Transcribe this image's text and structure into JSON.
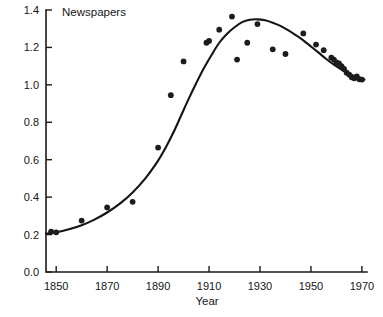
{
  "chart_data": {
    "type": "scatter",
    "title": "Newspapers",
    "xlabel": "Year",
    "ylabel": "",
    "xlim": [
      1846,
      1972
    ],
    "ylim": [
      0.0,
      1.4
    ],
    "grid": false,
    "legend": null,
    "xticks": [
      1850,
      1870,
      1890,
      1910,
      1930,
      1950,
      1970
    ],
    "xtick_labels": [
      "1850",
      "1870",
      "1890",
      "1910",
      "1930",
      "1950",
      "1970"
    ],
    "yticks": [
      0.0,
      0.2,
      0.4,
      0.6,
      0.8,
      1.0,
      1.2,
      1.4
    ],
    "ytick_labels": [
      "0.0",
      "0.2",
      "0.4",
      "0.6",
      "0.8",
      "1.0",
      "1.2",
      "1.4"
    ],
    "series": [
      {
        "name": "observed",
        "type": "scatter",
        "marker": "filled-circle",
        "color": "#1c1c1c",
        "points": [
          [
            1848,
            0.215
          ],
          [
            1850,
            0.212
          ],
          [
            1860,
            0.275
          ],
          [
            1870,
            0.345
          ],
          [
            1880,
            0.375
          ],
          [
            1890,
            0.665
          ],
          [
            1895,
            0.945
          ],
          [
            1900,
            1.125
          ],
          [
            1909,
            1.225
          ],
          [
            1910,
            1.235
          ],
          [
            1914,
            1.295
          ],
          [
            1919,
            1.365
          ],
          [
            1921,
            1.135
          ],
          [
            1925,
            1.225
          ],
          [
            1929,
            1.325
          ],
          [
            1935,
            1.19
          ],
          [
            1940,
            1.165
          ],
          [
            1947,
            1.275
          ],
          [
            1952,
            1.215
          ],
          [
            1955,
            1.185
          ],
          [
            1958,
            1.145
          ],
          [
            1959,
            1.135
          ],
          [
            1960,
            1.12
          ],
          [
            1961,
            1.115
          ],
          [
            1962,
            1.1
          ],
          [
            1963,
            1.085
          ],
          [
            1964,
            1.065
          ],
          [
            1965,
            1.055
          ],
          [
            1966,
            1.04
          ],
          [
            1967,
            1.035
          ],
          [
            1968,
            1.045
          ],
          [
            1969,
            1.03
          ],
          [
            1970,
            1.028
          ]
        ]
      },
      {
        "name": "fitted-curve",
        "type": "line",
        "color": "#141414",
        "points": [
          [
            1846,
            0.205
          ],
          [
            1850,
            0.212
          ],
          [
            1855,
            0.228
          ],
          [
            1860,
            0.25
          ],
          [
            1865,
            0.28
          ],
          [
            1870,
            0.318
          ],
          [
            1875,
            0.365
          ],
          [
            1880,
            0.425
          ],
          [
            1885,
            0.5
          ],
          [
            1890,
            0.595
          ],
          [
            1893,
            0.665
          ],
          [
            1896,
            0.745
          ],
          [
            1899,
            0.835
          ],
          [
            1902,
            0.925
          ],
          [
            1905,
            1.01
          ],
          [
            1908,
            1.09
          ],
          [
            1911,
            1.16
          ],
          [
            1914,
            1.225
          ],
          [
            1917,
            1.272
          ],
          [
            1920,
            1.308
          ],
          [
            1923,
            1.335
          ],
          [
            1926,
            1.348
          ],
          [
            1929,
            1.35
          ],
          [
            1932,
            1.345
          ],
          [
            1935,
            1.332
          ],
          [
            1938,
            1.315
          ],
          [
            1941,
            1.292
          ],
          [
            1944,
            1.266
          ],
          [
            1947,
            1.238
          ],
          [
            1950,
            1.205
          ],
          [
            1953,
            1.172
          ],
          [
            1956,
            1.138
          ],
          [
            1959,
            1.108
          ],
          [
            1962,
            1.082
          ],
          [
            1965,
            1.06
          ],
          [
            1968,
            1.042
          ],
          [
            1971,
            1.028
          ]
        ]
      }
    ]
  }
}
